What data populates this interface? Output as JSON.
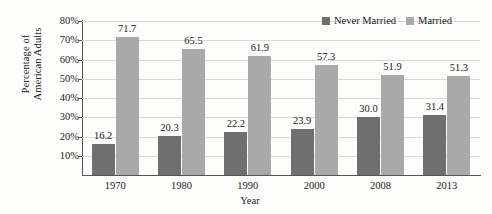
{
  "chart_data": {
    "type": "bar",
    "title": "",
    "subtitle": "",
    "xlabel": "Year",
    "ylabel": "Percentage of American Adults",
    "ylabel_line1": "Percentage of",
    "ylabel_line2": "American Adults",
    "categories": [
      "1970",
      "1980",
      "1990",
      "2000",
      "2008",
      "2013"
    ],
    "series": [
      {
        "name": "Never Married",
        "color": "#6f6f6f",
        "values": [
          16.2,
          20.3,
          22.2,
          23.9,
          30.0,
          31.4
        ],
        "labels": [
          "16.2",
          "20.3",
          "22.2",
          "23.9",
          "30.0",
          "31.4"
        ]
      },
      {
        "name": "Married",
        "color": "#a9a9a9",
        "values": [
          71.7,
          65.5,
          61.9,
          57.3,
          51.9,
          51.3
        ],
        "labels": [
          "71.7",
          "65.5",
          "61.9",
          "57.3",
          "51.9",
          "51.3"
        ]
      }
    ],
    "ylim": [
      0,
      80
    ],
    "yticks": [
      80,
      70,
      60,
      50,
      40,
      30,
      20,
      10
    ],
    "ytick_labels": [
      "80%",
      "70%",
      "60%",
      "50%",
      "40%",
      "30%",
      "20%",
      "10%"
    ],
    "grid": true,
    "grid_axis": "y",
    "legend_position": "top-right",
    "legend": [
      "Never Married",
      "Married"
    ],
    "bar_labels_shown": true
  }
}
